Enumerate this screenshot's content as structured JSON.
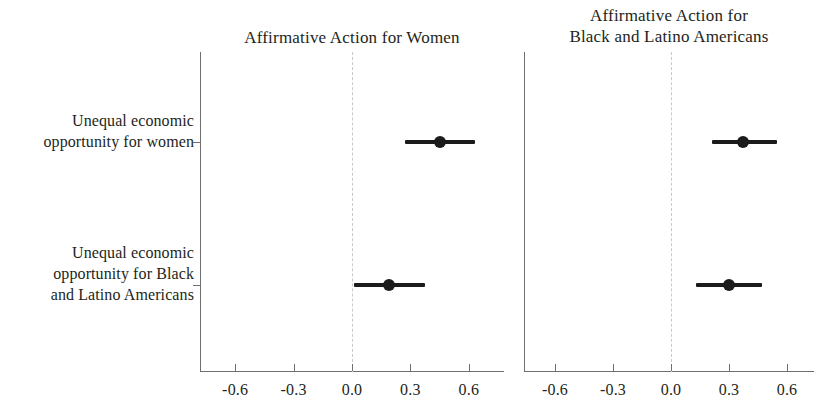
{
  "chart_data": {
    "type": "scatter",
    "plot_kind": "coefficient-plot",
    "title": "",
    "xlabel": "",
    "ylabel": "",
    "xlim": [
      -0.78,
      0.78
    ],
    "xticks": [
      -0.6,
      -0.3,
      0.0,
      0.3,
      0.6
    ],
    "xticklabels": [
      "-0.6",
      "-0.3",
      "0.0",
      "0.3",
      "0.6"
    ],
    "grid": false,
    "legend": "none",
    "zero_reference_line": 0.0,
    "categories": [
      "Unequal economic\nopportunity for women",
      "Unequal economic\nopportunity for Black\nand Latino Americans"
    ],
    "panels": [
      {
        "title": "Affirmative Action for Women",
        "estimates": [
          {
            "label": "Unequal economic opportunity for women",
            "value": 0.45,
            "ci_low": 0.27,
            "ci_high": 0.63
          },
          {
            "label": "Unequal economic opportunity for Black and Latino Americans",
            "value": 0.19,
            "ci_low": 0.01,
            "ci_high": 0.375
          }
        ]
      },
      {
        "title": "Affirmative Action for\nBlack and Latino Americans",
        "estimates": [
          {
            "label": "Unequal economic opportunity for women",
            "value": 0.37,
            "ci_low": 0.21,
            "ci_high": 0.55
          },
          {
            "label": "Unequal economic opportunity for Black and Latino Americans",
            "value": 0.3,
            "ci_low": 0.13,
            "ci_high": 0.47
          }
        ]
      }
    ]
  },
  "panel_left": {
    "title": "Affirmative Action for Women",
    "ticklabels": [
      "-0.6",
      "-0.3",
      "0.0",
      "0.3",
      "0.6"
    ]
  },
  "panel_right": {
    "title": "Affirmative Action for\nBlack and Latino Americans",
    "ticklabels": [
      "-0.6",
      "-0.3",
      "0.0",
      "0.3",
      "0.6"
    ]
  },
  "ylabels": [
    "Unequal economic\nopportunity for women",
    "Unequal economic\nopportunity for Black\nand Latino Americans"
  ],
  "colors": {
    "point": "#1b1b1b",
    "axis": "#6f6f6f",
    "zero_line": "#c9c9c9",
    "text": "#231f20",
    "background": "#ffffff"
  }
}
